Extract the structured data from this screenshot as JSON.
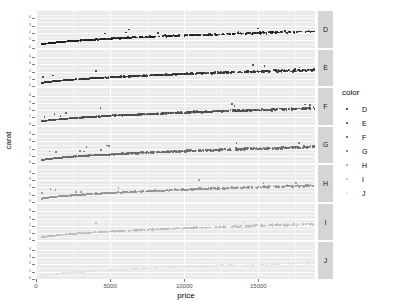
{
  "chart_data": {
    "type": "scatter",
    "title": "",
    "xlabel": "price",
    "ylabel": "carat",
    "xlim": [
      0,
      18823
    ],
    "ylim": [
      0,
      5.01
    ],
    "grid": true,
    "legend_position": "right",
    "legend_title": "color",
    "facet_variable": "color",
    "facet_direction": "rows",
    "x_ticks": [
      "0",
      "5000",
      "10000",
      "15000"
    ],
    "x_tick_values": [
      0,
      5000,
      10000,
      15000
    ],
    "y_ticks": [
      "0",
      "1",
      "2",
      "3",
      "4"
    ],
    "y_tick_values": [
      0,
      1,
      2,
      3,
      4
    ],
    "panel_background": "#ebebeb",
    "gridline_color": "#ffffff",
    "strip_background": "#d5d5d5",
    "legend_entries": [
      {
        "label": "D",
        "color": "#1f1f1f"
      },
      {
        "label": "E",
        "color": "#333333"
      },
      {
        "label": "F",
        "color": "#4d4d4d"
      },
      {
        "label": "G",
        "color": "#6b6b6b"
      },
      {
        "label": "H",
        "color": "#949494"
      },
      {
        "label": "I",
        "color": "#bdbdbd"
      },
      {
        "label": "J",
        "color": "#e0e0e0"
      }
    ],
    "facets": [
      {
        "label": "D",
        "color": "#1f1f1f",
        "n_points": 6775,
        "x_range": [
          357,
          18693
        ],
        "y_range": [
          0.2,
          3.4
        ],
        "trend": "carat increases with price, tight band widening at high price"
      },
      {
        "label": "E",
        "color": "#333333",
        "n_points": 9797,
        "x_range": [
          326,
          18731
        ],
        "y_range": [
          0.2,
          3.05
        ],
        "trend": "carat increases with price, tight band widening at high price"
      },
      {
        "label": "F",
        "color": "#4d4d4d",
        "n_points": 9542,
        "x_range": [
          342,
          18791
        ],
        "y_range": [
          0.2,
          3.01
        ],
        "trend": "carat increases with price, tight band widening at high price"
      },
      {
        "label": "G",
        "color": "#6b6b6b",
        "n_points": 11292,
        "x_range": [
          354,
          18818
        ],
        "y_range": [
          0.23,
          3.01
        ],
        "trend": "carat increases with price, broader scatter mid-range"
      },
      {
        "label": "H",
        "color": "#949494",
        "n_points": 8304,
        "x_range": [
          337,
          18803
        ],
        "y_range": [
          0.23,
          4.13
        ],
        "trend": "carat increases with price, noticeable upper outliers"
      },
      {
        "label": "I",
        "color": "#bdbdbd",
        "n_points": 5422,
        "x_range": [
          334,
          18823
        ],
        "y_range": [
          0.23,
          4.01
        ],
        "trend": "carat increases with price, light scatter"
      },
      {
        "label": "J",
        "color": "#e0e0e0",
        "n_points": 2808,
        "x_range": [
          335,
          18710
        ],
        "y_range": [
          0.23,
          5.01
        ],
        "trend": "carat increases with price, very light points nearly invisible"
      }
    ]
  }
}
